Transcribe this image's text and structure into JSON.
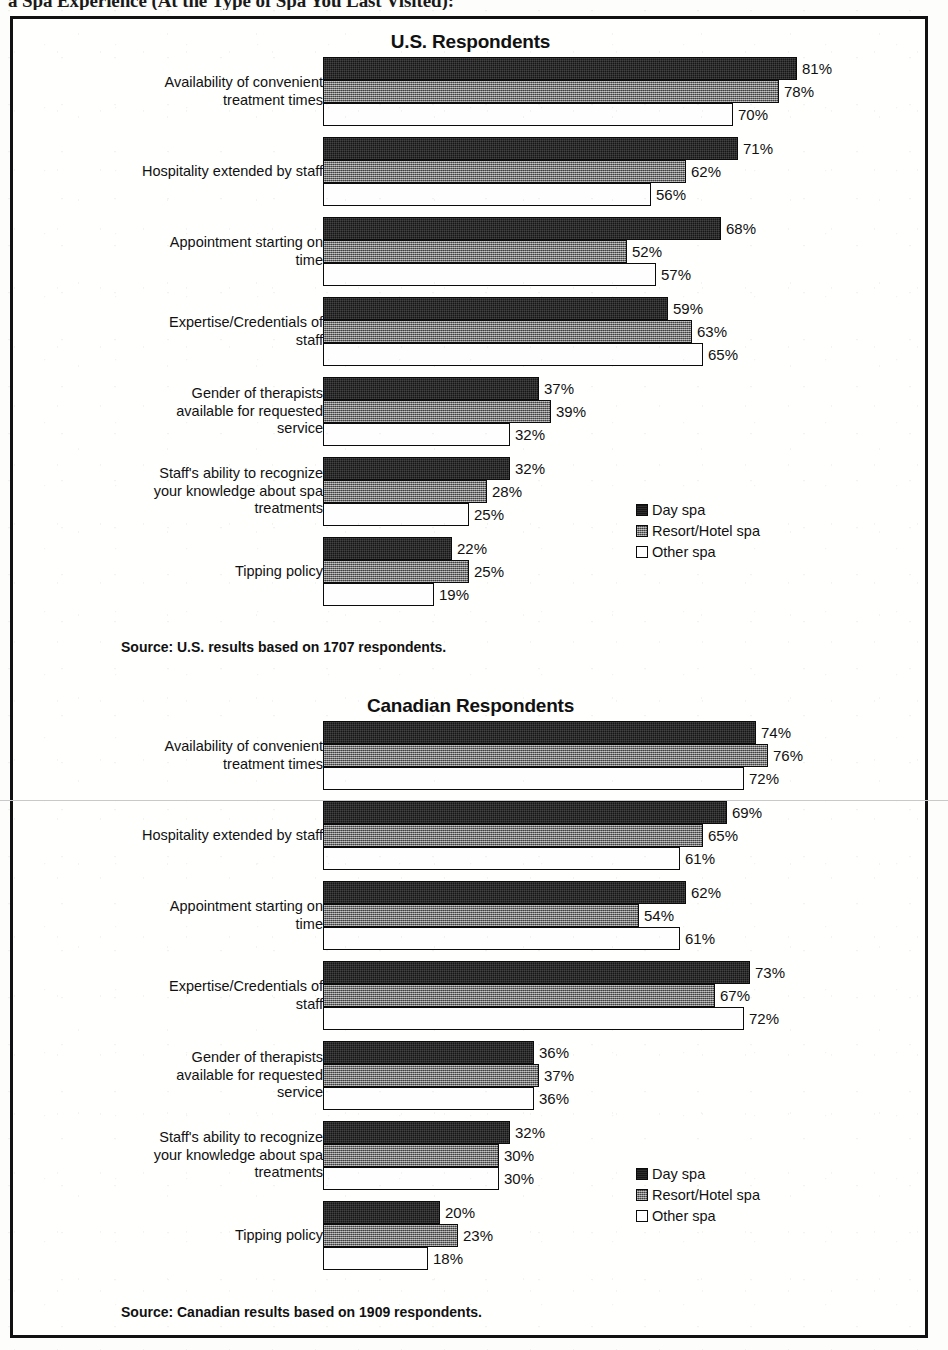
{
  "document": {
    "heading_partial": "a Spa Experience (At the Type of Spa You Last Visited):"
  },
  "legend": {
    "items": [
      {
        "label": "Day spa",
        "key": "day_spa"
      },
      {
        "label": "Resort/Hotel spa",
        "key": "resort_hotel_spa"
      },
      {
        "label": "Other spa",
        "key": "other_spa"
      }
    ]
  },
  "panels": [
    {
      "id": "us",
      "title": "U.S. Respondents",
      "source": "Source: U.S. results based on 1707 respondents."
    },
    {
      "id": "canada",
      "title": "Canadian Respondents",
      "source": "Source: Canadian results based on 1909 respondents."
    }
  ],
  "chart_data": [
    {
      "type": "bar",
      "orientation": "horizontal",
      "title": "U.S. Respondents",
      "xlabel": "",
      "ylabel": "",
      "xlim": [
        0,
        100
      ],
      "grid": false,
      "legend_position": "right-middle",
      "value_suffix": "%",
      "source": "Source: U.S. results based on 1707 respondents.",
      "categories": [
        "Availability of convenient treatment times",
        "Hospitality extended by staff",
        "Appointment starting on time",
        "Expertise/Credentials of staff",
        "Gender of therapists available for requested service",
        "Staff's ability to recognize your knowledge about spa treatments",
        "Tipping policy"
      ],
      "series": [
        {
          "name": "Day spa",
          "values": [
            81,
            71,
            68,
            59,
            37,
            32,
            22
          ]
        },
        {
          "name": "Resort/Hotel spa",
          "values": [
            78,
            62,
            52,
            63,
            39,
            28,
            25
          ]
        },
        {
          "name": "Other spa",
          "values": [
            70,
            56,
            57,
            65,
            32,
            25,
            19
          ]
        }
      ],
      "labels": [
        [
          "81%",
          "78%",
          "70%"
        ],
        [
          "71%",
          "62%",
          "56%"
        ],
        [
          "68%",
          "52%",
          "57%"
        ],
        [
          "59%",
          "63%",
          "65%"
        ],
        [
          "37%",
          "39%",
          "32%"
        ],
        [
          "32%",
          "28%",
          "25%"
        ],
        [
          "22%",
          "25%",
          "19%"
        ]
      ]
    },
    {
      "type": "bar",
      "orientation": "horizontal",
      "title": "Canadian Respondents",
      "xlabel": "",
      "ylabel": "",
      "xlim": [
        0,
        100
      ],
      "grid": false,
      "legend_position": "right-middle",
      "value_suffix": "%",
      "source": "Source: Canadian results based on 1909 respondents.",
      "categories": [
        "Availability of convenient treatment times",
        "Hospitality extended by staff",
        "Appointment starting on time",
        "Expertise/Credentials of staff",
        "Gender of therapists available for requested service",
        "Staff's ability to recognize your knowledge about spa treatments",
        "Tipping policy"
      ],
      "series": [
        {
          "name": "Day spa",
          "values": [
            74,
            69,
            62,
            73,
            36,
            32,
            20
          ]
        },
        {
          "name": "Resort/Hotel spa",
          "values": [
            76,
            65,
            54,
            67,
            37,
            30,
            23
          ]
        },
        {
          "name": "Other spa",
          "values": [
            72,
            61,
            61,
            72,
            36,
            30,
            18
          ]
        }
      ],
      "labels": [
        [
          "74%",
          "76%",
          "72%"
        ],
        [
          "69%",
          "65%",
          "61%"
        ],
        [
          "62%",
          "54%",
          "61%"
        ],
        [
          "73%",
          "67%",
          "72%"
        ],
        [
          "36%",
          "37%",
          "36%"
        ],
        [
          "32%",
          "30%",
          "30%"
        ],
        [
          "20%",
          "23%",
          "18%"
        ]
      ]
    }
  ],
  "category_lines": [
    [
      "Availability of convenient",
      "treatment times"
    ],
    [
      "Hospitality extended by staff"
    ],
    [
      "Appointment starting on",
      "time"
    ],
    [
      "Expertise/Credentials of",
      "staff"
    ],
    [
      "Gender of therapists",
      "available for requested",
      "service"
    ],
    [
      "Staff's ability to recognize",
      "your knowledge about spa",
      "treatments"
    ],
    [
      "Tipping policy"
    ]
  ]
}
